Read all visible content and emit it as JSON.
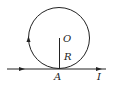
{
  "diagram": {
    "labels": {
      "center": "O",
      "radius": "R",
      "tangent_point": "A",
      "current": "I"
    },
    "colors": {
      "stroke": "#222222",
      "background": "#ffffff"
    }
  }
}
